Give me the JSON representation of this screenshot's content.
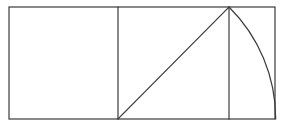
{
  "diagram": {
    "canvas": {
      "width": 283,
      "height": 127,
      "background": "#ffffff"
    },
    "stroke": {
      "color": "#3a3a3a",
      "width": 1.2
    },
    "outer_rectangle": {
      "x1": 9,
      "y1": 7,
      "x2": 275,
      "y2": 119
    },
    "square_divider": {
      "x": 118,
      "y1": 7,
      "y2": 119
    },
    "second_divider": {
      "x": 229,
      "y1": 7,
      "y2": 119
    },
    "diagonal": {
      "x1": 118,
      "y1": 119,
      "x2": 229,
      "y2": 7
    },
    "arc": {
      "center_x": 118,
      "center_y": 119,
      "start_x": 229,
      "start_y": 7,
      "end_x": 275,
      "end_y": 119,
      "radius": 157.7
    }
  }
}
